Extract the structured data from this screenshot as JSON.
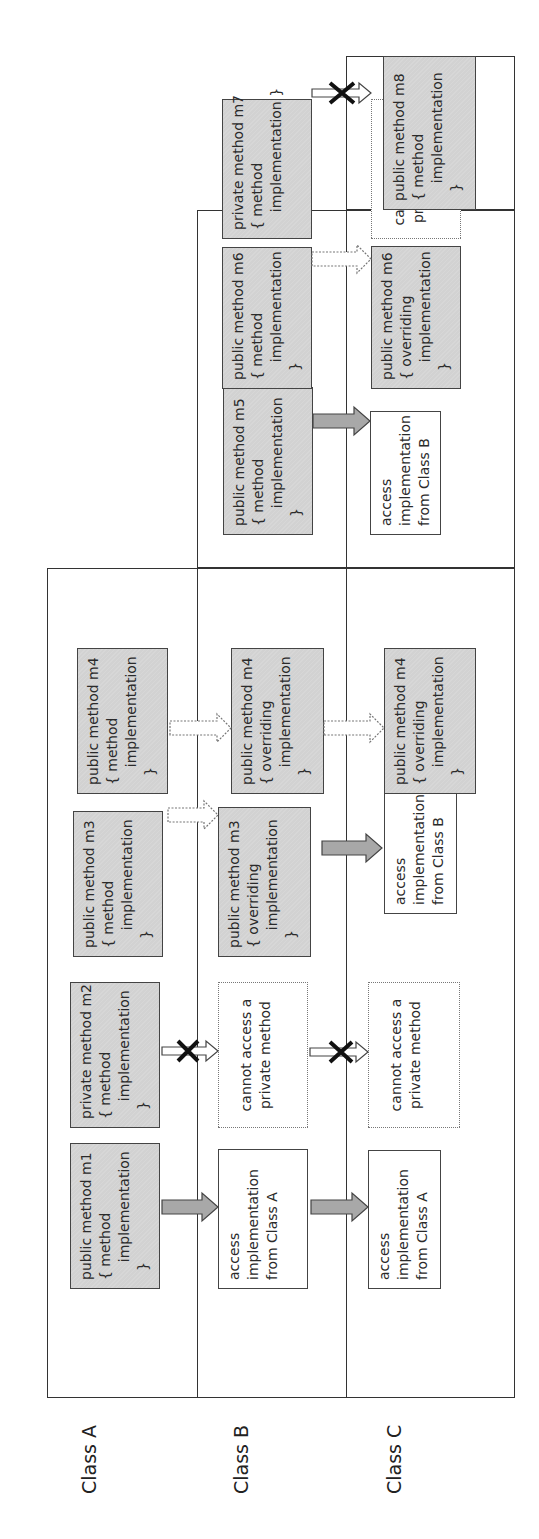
{
  "class_labels": {
    "a": "Class A",
    "b": "Class B",
    "c": "Class C"
  },
  "class_a": {
    "m1": "public method m1\n{ method\n    implementation\n  }",
    "m2": "private method m2\n{ method\n    implementation\n  }",
    "m3": "public method m3\n{ method\n    implementation\n  }",
    "m4": "public method m4\n{ method\n    implementation\n  }"
  },
  "class_b": {
    "m1": "access\nimplementation\nfrom Class A",
    "m2": "cannot access a\nprivate method",
    "m3": "public method m3\n{ overriding\n    implementation\n  }",
    "m4": "public method m4\n{ overriding\n    implementation\n  }",
    "m5": "public method m5\n{ method\n    implementation\n  }",
    "m6": "public method m6\n{ method\n    implementation\n  }",
    "m7": "private method m7\n{ method\n    implementation }"
  },
  "class_c": {
    "m1": "access\nimplementation\nfrom Class A",
    "m2": "cannot access a\nprivate method",
    "m3": "access\nimplementation\nfrom Class B",
    "m4": "public method m4\n{ overriding\n    implementation\n  }",
    "m5": "access\nimplementation\nfrom Class B",
    "m6": "public method m6\n{ overriding\n    implementation\n  }",
    "m7": "cannot access a\nprivate method",
    "m8": "public method m8\n{ method\n    implementation\n  }"
  },
  "legend_semantics": {
    "solid_gray_arrow": "inherited access",
    "dotted_white_arrow": "overridden",
    "crossed_white_arrow": "no access (private)"
  },
  "colors": {
    "box_fill": "#d2d2d2",
    "arrow_fill": "#a8a8a8",
    "line": "#333333",
    "cross": "#111111"
  }
}
